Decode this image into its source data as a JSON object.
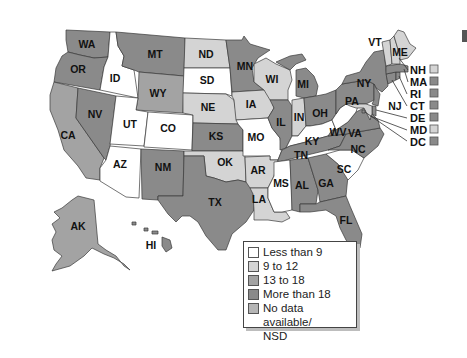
{
  "colors": {
    "less_than_9": "#ffffff",
    "9_to_12": "#d4d4d4",
    "13_to_18": "#a3a3a3",
    "more_than_18": "#8a8a8a",
    "no_data": "#b5b5b5"
  },
  "legend": {
    "items": [
      {
        "key": "less_than_9",
        "label": "Less than 9"
      },
      {
        "key": "9_to_12",
        "label": "9 to 12"
      },
      {
        "key": "13_to_18",
        "label": "13 to 18"
      },
      {
        "key": "more_than_18",
        "label": "More than 18"
      },
      {
        "key": "no_data",
        "label": "No data available/\nNSD"
      }
    ]
  },
  "states": {
    "WA": "more_than_18",
    "OR": "more_than_18",
    "CA": "13_to_18",
    "ID": "less_than_9",
    "NV": "more_than_18",
    "MT": "more_than_18",
    "WY": "13_to_18",
    "UT": "less_than_9",
    "CO": "less_than_9",
    "AZ": "less_than_9",
    "NM": "more_than_18",
    "ND": "9_to_12",
    "SD": "less_than_9",
    "NE": "9_to_12",
    "KS": "more_than_18",
    "OK": "9_to_12",
    "TX": "more_than_18",
    "MN": "more_than_18",
    "IA": "9_to_12",
    "MO": "less_than_9",
    "AR": "9_to_12",
    "LA": "9_to_12",
    "WI": "9_to_12",
    "IL": "more_than_18",
    "MI": "more_than_18",
    "IN": "9_to_12",
    "OH": "more_than_18",
    "KY": "less_than_9",
    "TN": "more_than_18",
    "MS": "less_than_9",
    "AL": "more_than_18",
    "GA": "more_than_18",
    "FL": "more_than_18",
    "SC": "less_than_9",
    "NC": "more_than_18",
    "VA": "more_than_18",
    "WV": "less_than_9",
    "PA": "more_than_18",
    "NY": "more_than_18",
    "VT": "9_to_12",
    "ME": "9_to_12",
    "NH": "9_to_12",
    "MA": "more_than_18",
    "RI": "more_than_18",
    "CT": "more_than_18",
    "NJ": "more_than_18",
    "DE": "more_than_18",
    "MD": "9_to_12",
    "DC": "more_than_18",
    "AK": "13_to_18",
    "HI": "more_than_18"
  },
  "map_labels": {
    "WA": "WA",
    "OR": "OR",
    "CA": "CA",
    "ID": "ID",
    "NV": "NV",
    "MT": "MT",
    "WY": "WY",
    "UT": "UT",
    "CO": "CO",
    "AZ": "AZ",
    "NM": "NM",
    "ND": "ND",
    "SD": "SD",
    "NE": "NE",
    "KS": "KS",
    "OK": "OK",
    "TX": "TX",
    "MN": "MN",
    "IA": "IA",
    "MO": "MO",
    "AR": "AR",
    "LA": "LA",
    "WI": "WI",
    "IL": "IL",
    "MI": "MI",
    "IN": "IN",
    "OH": "OH",
    "KY": "KY",
    "TN": "TN",
    "MS": "MS",
    "AL": "AL",
    "GA": "GA",
    "FL": "FL",
    "SC": "SC",
    "NC": "NC",
    "VA": "VA",
    "WV": "WV",
    "PA": "PA",
    "NY": "NY",
    "VT": "VT",
    "ME": "ME",
    "NJ": "NJ",
    "AK": "AK",
    "HI": "HI"
  },
  "callouts": [
    {
      "label": "NH",
      "state": "NH"
    },
    {
      "label": "MA",
      "state": "MA"
    },
    {
      "label": "RI",
      "state": "RI"
    },
    {
      "label": "CT",
      "state": "CT"
    },
    {
      "label": "DE",
      "state": "DE"
    },
    {
      "label": "MD",
      "state": "MD"
    },
    {
      "label": "DC",
      "state": "DC"
    }
  ]
}
